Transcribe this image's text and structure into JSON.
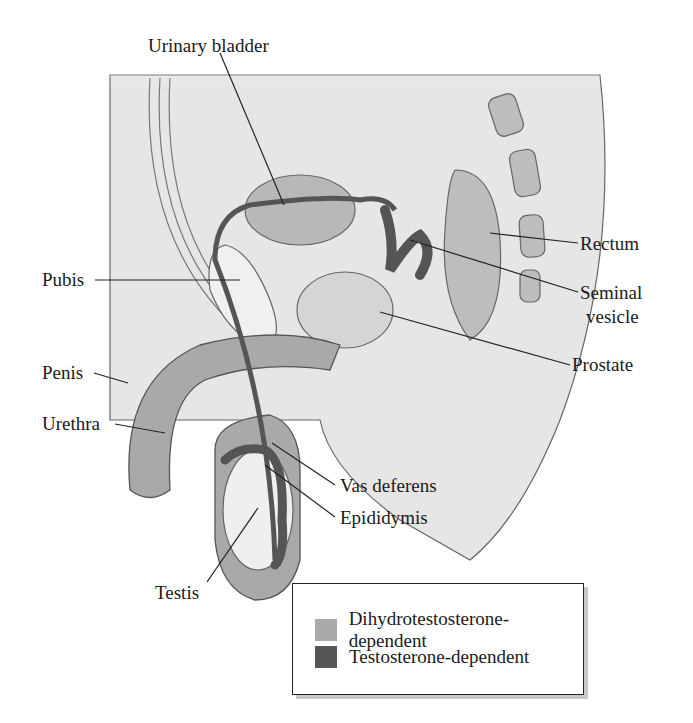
{
  "figure": {
    "type": "anatomical-diagram"
  },
  "labels": {
    "urinary_bladder": "Urinary bladder",
    "pubis": "Pubis",
    "rectum": "Rectum",
    "seminal_vesicle_line1": "Seminal",
    "seminal_vesicle_line2": "vesicle",
    "prostate": "Prostate",
    "penis": "Penis",
    "urethra": "Urethra",
    "vas_deferens": "Vas deferens",
    "epididymis": "Epididymis",
    "testis": "Testis"
  },
  "legend": {
    "items": [
      {
        "label": "Dihydrotestosterone-dependent",
        "color": "#a9a9a9"
      },
      {
        "label": "Testosterone-dependent",
        "color": "#555555"
      }
    ]
  },
  "colors": {
    "tissue_light": "#e6e6e6",
    "tissue_mid": "#cfcfcf",
    "dht_gray": "#a9a9a9",
    "testosterone_dark": "#555555",
    "outline": "#555555",
    "leader_line": "#222222"
  }
}
